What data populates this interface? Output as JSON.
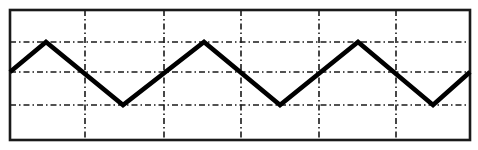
{
  "figure": {
    "background_color": "#ffffff",
    "border_color": "#1a1a1a",
    "grid_color": "#1a1a1a",
    "trace_color": "#000000",
    "frame": {
      "x": 10,
      "y": 10,
      "width": 460,
      "height": 130,
      "border_width": 2.6
    },
    "grid": {
      "vertical_lines_x": [
        85,
        164,
        241,
        319,
        396
      ],
      "horizontal_lines_y": [
        42,
        72,
        105
      ],
      "line_width": 1.6,
      "dash_pattern": "6 3 1.5 3",
      "columns": 6,
      "rows": 4
    },
    "trace": {
      "line_width": 4.6,
      "points_x": [
        10,
        46,
        123,
        204,
        280,
        358,
        433,
        470
      ],
      "points_y": [
        72,
        42,
        105,
        42,
        105,
        42,
        105,
        72
      ],
      "polyline": "10,72 46,42 123,105 204,42 280,105 358,42 433,105 470,72"
    }
  },
  "chart_data": {
    "type": "line",
    "title": "Triangular waveform displayed on an oscilloscope graticule",
    "subtitle": "",
    "xlabel": "",
    "ylabel": "",
    "grid": true,
    "legend": "none",
    "xlim": [
      0,
      6
    ],
    "ylim": [
      -2,
      2
    ],
    "xticks": [
      0,
      1,
      2,
      3,
      4,
      5,
      6
    ],
    "yticks": [
      -2,
      -1,
      0,
      1,
      2
    ],
    "xtick_labels": [
      "",
      "",
      "",
      "",
      "",
      "",
      ""
    ],
    "ytick_labels": [
      "",
      "",
      "",
      "",
      ""
    ],
    "annotations": [],
    "series": [
      {
        "name": "triangle-wave",
        "color": "#000000",
        "x": [
          0,
          0.47,
          1.47,
          2.53,
          3.53,
          4.54,
          5.52,
          6.0
        ],
        "y": [
          0,
          1,
          -1,
          1,
          -1,
          1,
          -1,
          0
        ],
        "waveform": "triangle",
        "period_divisions": 2.02,
        "amplitude_divisions": 1,
        "peak_value": 1,
        "trough_value": -1,
        "cycles_shown": 3
      }
    ]
  }
}
